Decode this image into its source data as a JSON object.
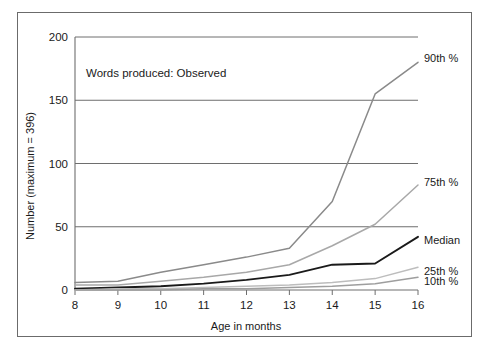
{
  "figure": {
    "annotation": "Words produced: Observed"
  },
  "chart_data": {
    "type": "line",
    "title": "Words produced: Observed",
    "xlabel": "Age in months",
    "ylabel": "Number (maximum = 396)",
    "x": [
      8,
      9,
      10,
      11,
      12,
      13,
      14,
      15,
      16
    ],
    "xlim": [
      8,
      16
    ],
    "ylim": [
      0,
      200
    ],
    "xticks": [
      "8",
      "9",
      "10",
      "11",
      "12",
      "13",
      "14",
      "15",
      "16"
    ],
    "yticks": [
      "0",
      "50",
      "100",
      "150",
      "200"
    ],
    "grid": "horizontal",
    "legend_position": "right-inline",
    "series": [
      {
        "name": "90th %",
        "label": "90th %",
        "color": "#8a8a8a",
        "values": [
          6,
          7,
          14,
          20,
          26,
          33,
          70,
          155,
          180
        ]
      },
      {
        "name": "75th %",
        "label": "75th %",
        "color": "#a8a8a8",
        "values": [
          4,
          4,
          7,
          10,
          14,
          20,
          35,
          52,
          83
        ]
      },
      {
        "name": "Median",
        "label": "Median",
        "color": "#1a1a1a",
        "values": [
          1,
          2,
          3,
          5,
          8,
          12,
          20,
          21,
          42
        ]
      },
      {
        "name": "25th %",
        "label": "25th %",
        "color": "#bdbdbd",
        "values": [
          0,
          1,
          1,
          2,
          3,
          4,
          6,
          9,
          18
        ]
      },
      {
        "name": "10th %",
        "label": "10th %",
        "color": "#9e9e9e",
        "values": [
          0,
          0,
          0,
          1,
          1,
          2,
          3,
          5,
          10
        ]
      }
    ]
  }
}
